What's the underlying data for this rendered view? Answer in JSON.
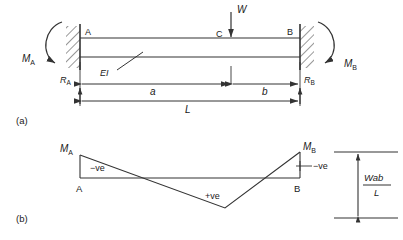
{
  "figure": {
    "stroke_color": "#333333",
    "background": "#ffffff",
    "panels": [
      {
        "key": "a",
        "label": "(a)",
        "caption": "Beam with fixed ends, point load W at C"
      },
      {
        "key": "b",
        "label": "(b)",
        "caption": "Bending moment diagram"
      }
    ]
  },
  "beam_diagram": {
    "panel_label": "(a)",
    "point_a_label": "A",
    "point_b_label": "B",
    "point_c_label": "C",
    "load_label": "W",
    "stiffness_label": "EI",
    "moment_a_label": "M",
    "moment_a_sub": "A",
    "moment_b_label": "M",
    "moment_b_sub": "B",
    "reaction_a_label": "R",
    "reaction_a_sub": "A",
    "reaction_b_label": "R",
    "reaction_b_sub": "B",
    "dim_a_label": "a",
    "dim_b_label": "b",
    "dim_l_label": "L"
  },
  "bmd_diagram": {
    "panel_label": "(b)",
    "point_a_label": "A",
    "point_b_label": "B",
    "moment_a_label": "M",
    "moment_a_sub": "A",
    "moment_b_label": "M",
    "moment_b_sub": "B",
    "negative_left_label": "−ve",
    "negative_right_label": "−ve",
    "positive_label": "+ve",
    "ordinate_numerator": "Wab",
    "ordinate_denominator": "L"
  }
}
